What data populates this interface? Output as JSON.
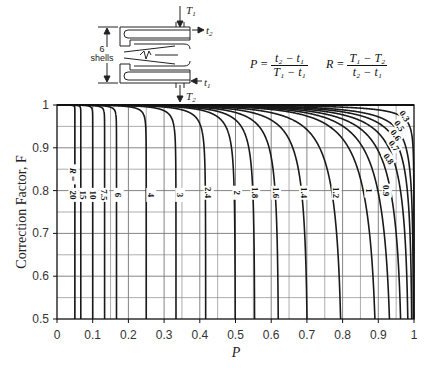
{
  "diagram": {
    "shells_label_line1": "6",
    "shells_label_line2": "shells",
    "T1": "T",
    "T1_sub": "1",
    "T2": "T",
    "T2_sub": "2",
    "t1": "t",
    "t1_sub": "1",
    "t2": "t",
    "t2_sub": "2"
  },
  "formulas": {
    "P_lhs": "P =",
    "P_num": "t₂ − t₁",
    "P_den": "T₁ − t₁",
    "R_lhs": "R =",
    "R_num": "T₁ − T₂",
    "R_den": "t₂ − t₁"
  },
  "chart_data": {
    "type": "line",
    "title": "",
    "xlabel": "P",
    "ylabel": "Correction Factor, F",
    "xlim": [
      0,
      1
    ],
    "ylim": [
      0.5,
      1
    ],
    "grid": true,
    "shell_passes": 6,
    "x_ticks": [
      "0",
      "0.1",
      "0.2",
      "0.3",
      "0.4",
      "0.5",
      "0.6",
      "0.7",
      "0.8",
      "0.9",
      "1"
    ],
    "y_ticks": [
      "0.5",
      "0.6",
      "0.7",
      "0.8",
      "0.9",
      "1"
    ],
    "series_label_prefix": "R =",
    "series": [
      {
        "name": "20",
        "R": 20
      },
      {
        "name": "15",
        "R": 15
      },
      {
        "name": "10",
        "R": 10
      },
      {
        "name": "7.5",
        "R": 7.5
      },
      {
        "name": "6",
        "R": 6
      },
      {
        "name": "4",
        "R": 4
      },
      {
        "name": "3",
        "R": 3
      },
      {
        "name": "2.4",
        "R": 2.4
      },
      {
        "name": "2",
        "R": 2
      },
      {
        "name": "1.8",
        "R": 1.8
      },
      {
        "name": "1.6",
        "R": 1.6
      },
      {
        "name": "1.4",
        "R": 1.4
      },
      {
        "name": "1.2",
        "R": 1.2
      },
      {
        "name": "1",
        "R": 1
      },
      {
        "name": "0.9",
        "R": 0.9
      },
      {
        "name": "0.8",
        "R": 0.8
      },
      {
        "name": "0.7",
        "R": 0.7
      },
      {
        "name": "0.6",
        "R": 0.6
      },
      {
        "name": "0.5",
        "R": 0.5
      },
      {
        "name": "0.3",
        "R": 0.3
      }
    ],
    "label_positions": {
      "20": {
        "x": 0.046,
        "y": 0.79
      },
      "15": {
        "x": 0.075,
        "y": 0.79
      },
      "10": {
        "x": 0.103,
        "y": 0.79
      },
      "7.5": {
        "x": 0.132,
        "y": 0.79
      },
      "6": {
        "x": 0.173,
        "y": 0.79
      },
      "4": {
        "x": 0.264,
        "y": 0.79
      },
      "3": {
        "x": 0.345,
        "y": 0.79
      },
      "2.4": {
        "x": 0.425,
        "y": 0.795
      },
      "2": {
        "x": 0.505,
        "y": 0.795
      },
      "1.8": {
        "x": 0.555,
        "y": 0.795
      },
      "1.6": {
        "x": 0.614,
        "y": 0.795
      },
      "1.4": {
        "x": 0.692,
        "y": 0.795
      },
      "1.2": {
        "x": 0.783,
        "y": 0.795
      },
      "1": {
        "x": 0.875,
        "y": 0.8
      },
      "0.9": {
        "x": 0.924,
        "y": 0.8
      },
      "0.8": {
        "x": 0.93,
        "y": 0.875
      },
      "0.7": {
        "x": 0.945,
        "y": 0.905
      },
      "0.6": {
        "x": 0.95,
        "y": 0.93
      },
      "0.5": {
        "x": 0.96,
        "y": 0.952
      },
      "0.3": {
        "x": 0.975,
        "y": 0.975
      }
    }
  }
}
